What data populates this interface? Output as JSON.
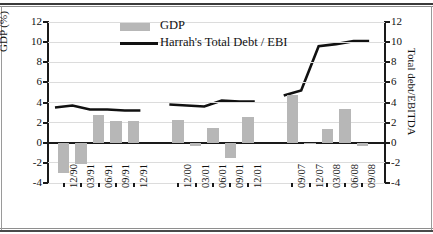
{
  "legend": {
    "gdp_label": "GDP",
    "debt_label": "Harrah's Total Debt / EBI",
    "bar_color": "#b7b7b7",
    "line_color": "#111111"
  },
  "axes": {
    "left_title": "GDP (%)",
    "right_title": "Total debt/EBITDA",
    "ticks": [
      "12",
      "10",
      "8",
      "6",
      "4",
      "2",
      "0",
      "-2",
      "-4"
    ],
    "right_ticks": [
      "12",
      "10",
      "8",
      "6",
      "4",
      "2",
      "0",
      "-2",
      "-4"
    ],
    "ymin": -4,
    "ymax": 12
  },
  "chart_data": {
    "type": "bar",
    "title": "",
    "xlabel": "",
    "ylabel": "GDP (%)",
    "y2label": "Total debt/EBITDA",
    "ylim": [
      -4,
      12
    ],
    "y2lim": [
      -4,
      12
    ],
    "grid": true,
    "legend_position": "top-center",
    "categories": [
      "12/90",
      "03/91",
      "06/91",
      "09/91",
      "12/91",
      "12/00",
      "03/01",
      "06/01",
      "09/01",
      "12/01",
      "09/07",
      "12/07",
      "03/08",
      "06/08",
      "09/08"
    ],
    "group_breaks": [
      5,
      10
    ],
    "series": [
      {
        "name": "GDP",
        "type": "bar",
        "axis": "left",
        "color": "#b7b7b7",
        "values": [
          -3.0,
          -2.1,
          2.8,
          2.2,
          2.2,
          2.3,
          -0.3,
          1.5,
          -1.5,
          2.6,
          4.7,
          -0.15,
          1.4,
          3.4,
          -0.3
        ]
      },
      {
        "name": "Harrah's Total Debt / EBITDA",
        "type": "line",
        "axis": "right",
        "color": "#111111",
        "values": [
          3.5,
          3.7,
          3.3,
          3.3,
          3.2,
          3.8,
          3.7,
          3.6,
          4.2,
          4.1,
          4.7,
          5.2,
          9.6,
          9.8,
          10.1
        ]
      }
    ]
  }
}
